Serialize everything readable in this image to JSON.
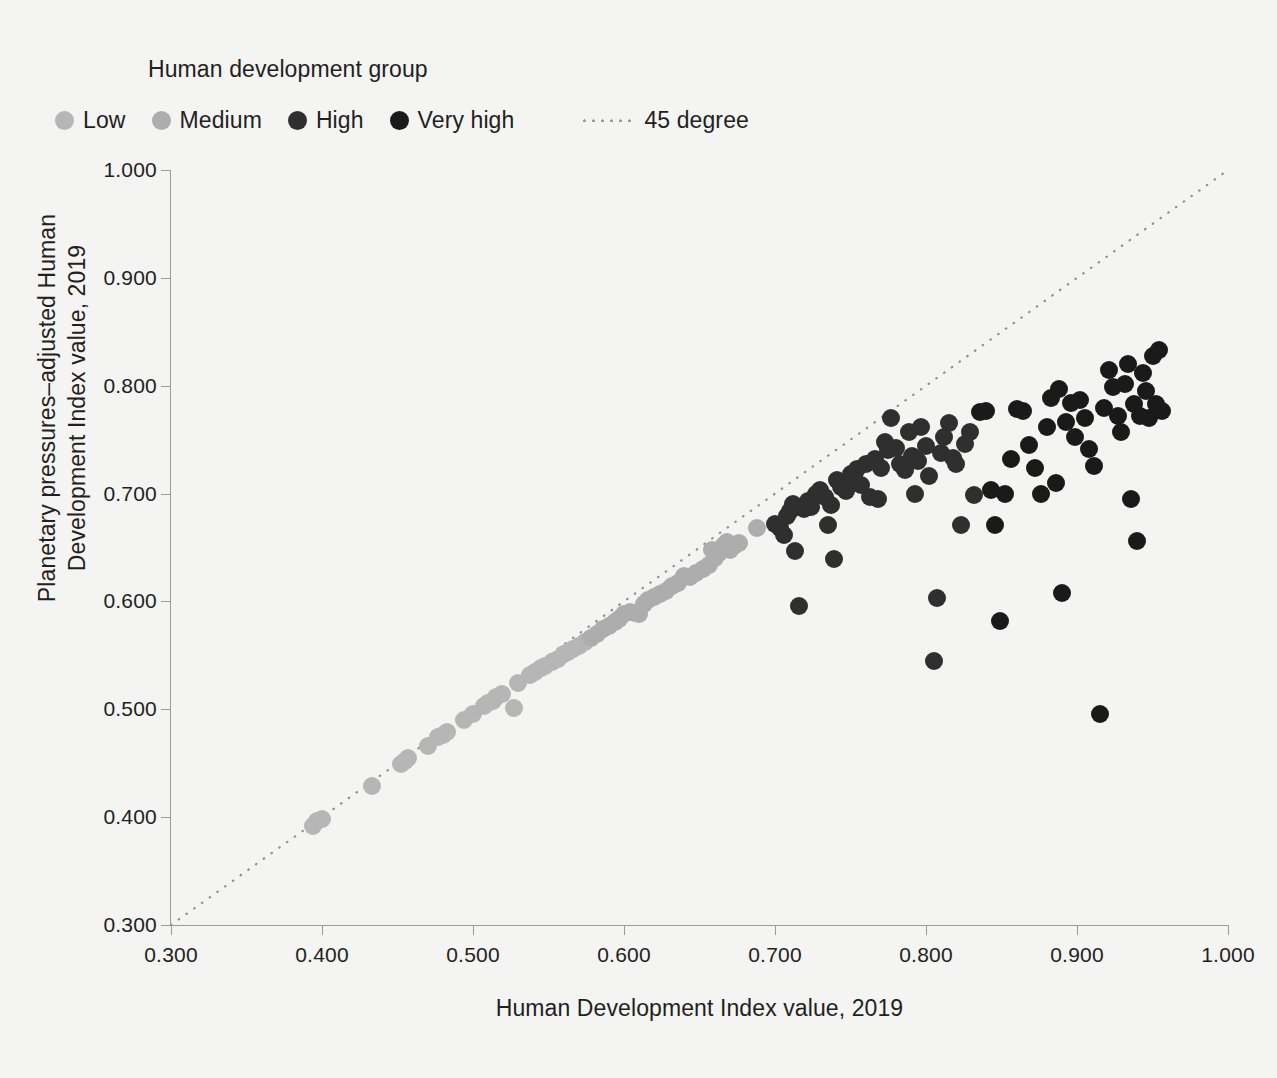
{
  "legend": {
    "title": "Human development group",
    "items": [
      {
        "label": "Low",
        "color": "#b6b6b6",
        "icon": "circle-marker-icon"
      },
      {
        "label": "Medium",
        "color": "#adadad",
        "icon": "circle-marker-icon"
      },
      {
        "label": "High",
        "color": "#2f2f2f",
        "icon": "circle-marker-icon"
      },
      {
        "label": "Very high",
        "color": "#1a1a1a",
        "icon": "circle-marker-icon"
      }
    ],
    "reference_line": {
      "label": "45 degree",
      "color": "#9a9a9a",
      "style": "dotted"
    }
  },
  "chart_data": {
    "type": "scatter",
    "title": "",
    "xlabel": "Human Development Index value, 2019",
    "ylabel": "Planetary pressures–adjusted Human Development Index value, 2019",
    "ylabel_lines": [
      "Planetary pressures–adjusted Human",
      "Development Index value, 2019"
    ],
    "xlim": [
      0.3,
      1.0
    ],
    "ylim": [
      0.3,
      1.0
    ],
    "xticks": [
      "0.300",
      "0.400",
      "0.500",
      "0.600",
      "0.700",
      "0.800",
      "0.900",
      "1.000"
    ],
    "xtick_values": [
      0.3,
      0.4,
      0.5,
      0.6,
      0.7,
      0.8,
      0.9,
      1.0
    ],
    "yticks": [
      "0.300",
      "0.400",
      "0.500",
      "0.600",
      "0.700",
      "0.800",
      "0.900",
      "1.000"
    ],
    "ytick_values": [
      0.3,
      0.4,
      0.5,
      0.6,
      0.7,
      0.8,
      0.9,
      1.0
    ],
    "grid": false,
    "legend_position": "top-left",
    "background": "#f4f4f2",
    "reference_line": {
      "label": "45 degree",
      "from": [
        0.3,
        0.3
      ],
      "to": [
        1.0,
        1.0
      ],
      "style": "dotted",
      "color": "#9a9a9a"
    },
    "marker_radius_px": 9,
    "series": [
      {
        "name": "Low",
        "color": "#b6b6b6",
        "points": [
          [
            0.394,
            0.392
          ],
          [
            0.397,
            0.396
          ],
          [
            0.4,
            0.398
          ],
          [
            0.433,
            0.429
          ],
          [
            0.452,
            0.449
          ],
          [
            0.455,
            0.452
          ],
          [
            0.457,
            0.455
          ],
          [
            0.47,
            0.466
          ],
          [
            0.477,
            0.474
          ],
          [
            0.48,
            0.476
          ],
          [
            0.483,
            0.479
          ],
          [
            0.494,
            0.49
          ],
          [
            0.5,
            0.496
          ],
          [
            0.507,
            0.503
          ],
          [
            0.51,
            0.506
          ],
          [
            0.513,
            0.508
          ],
          [
            0.515,
            0.511
          ],
          [
            0.519,
            0.514
          ],
          [
            0.527,
            0.501
          ],
          [
            0.53,
            0.524
          ],
          [
            0.538,
            0.532
          ],
          [
            0.541,
            0.535
          ],
          [
            0.545,
            0.538
          ],
          [
            0.548,
            0.54
          ],
          [
            0.552,
            0.544
          ],
          [
            0.556,
            0.547
          ],
          [
            0.56,
            0.551
          ],
          [
            0.563,
            0.553
          ],
          [
            0.566,
            0.556
          ],
          [
            0.57,
            0.559
          ],
          [
            0.574,
            0.562
          ]
        ]
      },
      {
        "name": "Medium",
        "color": "#adadad",
        "points": [
          [
            0.578,
            0.566
          ],
          [
            0.582,
            0.57
          ],
          [
            0.586,
            0.574
          ],
          [
            0.59,
            0.577
          ],
          [
            0.594,
            0.581
          ],
          [
            0.597,
            0.584
          ],
          [
            0.6,
            0.588
          ],
          [
            0.604,
            0.59
          ],
          [
            0.607,
            0.589
          ],
          [
            0.61,
            0.588
          ],
          [
            0.613,
            0.598
          ],
          [
            0.616,
            0.601
          ],
          [
            0.62,
            0.604
          ],
          [
            0.624,
            0.607
          ],
          [
            0.628,
            0.61
          ],
          [
            0.632,
            0.614
          ],
          [
            0.636,
            0.617
          ],
          [
            0.64,
            0.624
          ],
          [
            0.644,
            0.623
          ],
          [
            0.648,
            0.626
          ],
          [
            0.652,
            0.63
          ],
          [
            0.656,
            0.634
          ],
          [
            0.658,
            0.648
          ],
          [
            0.66,
            0.64
          ],
          [
            0.663,
            0.645
          ],
          [
            0.666,
            0.652
          ],
          [
            0.668,
            0.655
          ],
          [
            0.67,
            0.648
          ],
          [
            0.673,
            0.651
          ],
          [
            0.676,
            0.654
          ],
          [
            0.688,
            0.668
          ]
        ]
      },
      {
        "name": "High",
        "color": "#2f2f2f",
        "points": [
          [
            0.7,
            0.672
          ],
          [
            0.703,
            0.668
          ],
          [
            0.706,
            0.662
          ],
          [
            0.708,
            0.679
          ],
          [
            0.71,
            0.684
          ],
          [
            0.712,
            0.69
          ],
          [
            0.714,
            0.688
          ],
          [
            0.713,
            0.647
          ],
          [
            0.716,
            0.596
          ],
          [
            0.719,
            0.686
          ],
          [
            0.722,
            0.693
          ],
          [
            0.724,
            0.688
          ],
          [
            0.727,
            0.7
          ],
          [
            0.73,
            0.703
          ],
          [
            0.733,
            0.697
          ],
          [
            0.735,
            0.671
          ],
          [
            0.737,
            0.689
          ],
          [
            0.739,
            0.639
          ],
          [
            0.741,
            0.713
          ],
          [
            0.744,
            0.706
          ],
          [
            0.747,
            0.702
          ],
          [
            0.75,
            0.718
          ],
          [
            0.752,
            0.716
          ],
          [
            0.754,
            0.723
          ],
          [
            0.757,
            0.708
          ],
          [
            0.76,
            0.727
          ],
          [
            0.763,
            0.697
          ],
          [
            0.766,
            0.732
          ],
          [
            0.768,
            0.695
          ],
          [
            0.77,
            0.724
          ],
          [
            0.773,
            0.748
          ],
          [
            0.775,
            0.74
          ],
          [
            0.777,
            0.77
          ],
          [
            0.78,
            0.742
          ],
          [
            0.783,
            0.727
          ],
          [
            0.786,
            0.722
          ],
          [
            0.789,
            0.757
          ],
          [
            0.791,
            0.735
          ],
          [
            0.793,
            0.7
          ],
          [
            0.795,
            0.73
          ],
          [
            0.797,
            0.762
          ],
          [
            0.8,
            0.744
          ],
          [
            0.802,
            0.716
          ],
          [
            0.805,
            0.545
          ],
          [
            0.807,
            0.603
          ],
          [
            0.81,
            0.738
          ],
          [
            0.812,
            0.752
          ],
          [
            0.815,
            0.765
          ],
          [
            0.818,
            0.733
          ],
          [
            0.82,
            0.727
          ],
          [
            0.823,
            0.671
          ],
          [
            0.826,
            0.746
          ],
          [
            0.829,
            0.757
          ],
          [
            0.832,
            0.699
          ]
        ]
      },
      {
        "name": "Very high",
        "color": "#1a1a1a",
        "points": [
          [
            0.836,
            0.776
          ],
          [
            0.84,
            0.777
          ],
          [
            0.843,
            0.703
          ],
          [
            0.846,
            0.671
          ],
          [
            0.849,
            0.582
          ],
          [
            0.852,
            0.7
          ],
          [
            0.856,
            0.732
          ],
          [
            0.86,
            0.778
          ],
          [
            0.864,
            0.777
          ],
          [
            0.868,
            0.745
          ],
          [
            0.872,
            0.724
          ],
          [
            0.876,
            0.7
          ],
          [
            0.88,
            0.762
          ],
          [
            0.883,
            0.789
          ],
          [
            0.886,
            0.71
          ],
          [
            0.888,
            0.797
          ],
          [
            0.89,
            0.608
          ],
          [
            0.893,
            0.766
          ],
          [
            0.896,
            0.784
          ],
          [
            0.899,
            0.752
          ],
          [
            0.902,
            0.787
          ],
          [
            0.905,
            0.77
          ],
          [
            0.908,
            0.741
          ],
          [
            0.911,
            0.726
          ],
          [
            0.915,
            0.496
          ],
          [
            0.918,
            0.779
          ],
          [
            0.921,
            0.815
          ],
          [
            0.924,
            0.799
          ],
          [
            0.927,
            0.772
          ],
          [
            0.929,
            0.757
          ],
          [
            0.932,
            0.802
          ],
          [
            0.934,
            0.82
          ],
          [
            0.936,
            0.695
          ],
          [
            0.938,
            0.783
          ],
          [
            0.94,
            0.656
          ],
          [
            0.942,
            0.772
          ],
          [
            0.944,
            0.812
          ],
          [
            0.946,
            0.795
          ],
          [
            0.948,
            0.77
          ],
          [
            0.95,
            0.828
          ],
          [
            0.952,
            0.783
          ],
          [
            0.954,
            0.833
          ],
          [
            0.956,
            0.777
          ]
        ]
      }
    ]
  }
}
